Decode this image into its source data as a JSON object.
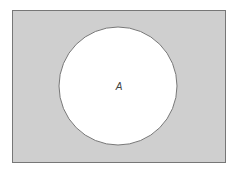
{
  "diagram": {
    "type": "venn",
    "universe": {
      "shaded": true,
      "fill": "#cfcfcf",
      "stroke": "#777777"
    },
    "sets": [
      {
        "label": "A",
        "shaded": false,
        "fill": "#ffffff",
        "stroke": "#777777"
      }
    ],
    "shaded_region": "complement of A"
  }
}
